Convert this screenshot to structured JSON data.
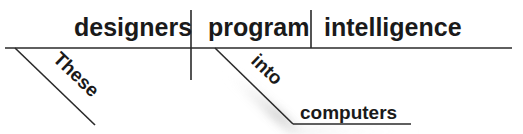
{
  "diagram": {
    "type": "sentence-diagram",
    "sentence": "These designers program intelligence into computers",
    "subject": "designers",
    "verb": "program",
    "object": "intelligence",
    "subject_modifier": "These",
    "preposition": "into",
    "prepositional_object": "computers",
    "colors": {
      "ink": "#1a1a1a",
      "shadow": "#bbbbbb",
      "background": "#ffffff"
    }
  }
}
